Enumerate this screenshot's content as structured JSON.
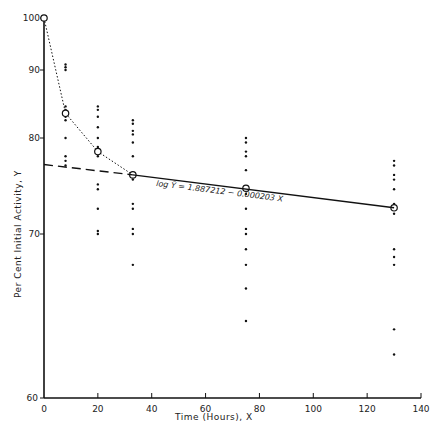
{
  "chart_data": {
    "type": "scatter",
    "title": "",
    "xlabel": "Time (Hours), X",
    "ylabel": "Per Cent Initial Activity, Y",
    "xlim": [
      0,
      140
    ],
    "ylim": [
      60,
      100
    ],
    "x_ticks": [
      0,
      20,
      40,
      60,
      80,
      100,
      120,
      140
    ],
    "y_ticks": [
      60,
      70,
      80,
      90,
      100
    ],
    "y_scale": "log",
    "grid": false,
    "legend": null,
    "annotation": "log Ŷ = 1.887212 − 0.000203 X",
    "series": [
      {
        "name": "observations",
        "style": "dots",
        "points": [
          [
            8,
            91
          ],
          [
            8,
            90.5
          ],
          [
            8,
            90
          ],
          [
            8,
            84.5
          ],
          [
            8,
            84
          ],
          [
            8,
            83.5
          ],
          [
            8,
            83
          ],
          [
            8,
            82.5
          ],
          [
            8,
            80
          ],
          [
            8,
            78
          ],
          [
            8,
            77.5
          ],
          [
            8,
            77
          ],
          [
            20,
            84.5
          ],
          [
            20,
            84
          ],
          [
            20,
            83
          ],
          [
            20,
            81.5
          ],
          [
            20,
            80
          ],
          [
            20,
            79
          ],
          [
            20,
            78
          ],
          [
            20,
            75
          ],
          [
            20,
            74.5
          ],
          [
            20,
            72.5
          ],
          [
            20,
            70.3
          ],
          [
            20,
            70
          ],
          [
            33,
            82.5
          ],
          [
            33,
            82
          ],
          [
            33,
            81
          ],
          [
            33,
            80.5
          ],
          [
            33,
            79.5
          ],
          [
            33,
            78
          ],
          [
            33,
            75.5
          ],
          [
            33,
            73
          ],
          [
            33,
            72.5
          ],
          [
            33,
            70.5
          ],
          [
            33,
            70
          ],
          [
            33,
            68
          ],
          [
            75,
            80
          ],
          [
            75,
            79.5
          ],
          [
            75,
            78.5
          ],
          [
            75,
            78
          ],
          [
            75,
            76.5
          ],
          [
            75,
            74
          ],
          [
            75,
            72.5
          ],
          [
            75,
            70.5
          ],
          [
            75,
            70
          ],
          [
            75,
            69
          ],
          [
            75,
            68
          ],
          [
            75,
            66.5
          ],
          [
            75,
            64.5
          ],
          [
            130,
            77.5
          ],
          [
            130,
            77
          ],
          [
            130,
            76
          ],
          [
            130,
            75.5
          ],
          [
            130,
            74.5
          ],
          [
            130,
            73
          ],
          [
            130,
            72.8
          ],
          [
            130,
            72
          ],
          [
            130,
            69
          ],
          [
            130,
            68.5
          ],
          [
            130,
            68
          ],
          [
            130,
            64
          ],
          [
            130,
            62.5
          ]
        ]
      },
      {
        "name": "means",
        "style": "open-circles-dotted-line",
        "points": [
          [
            0,
            100
          ],
          [
            8,
            83.5
          ],
          [
            20,
            78.5
          ],
          [
            33,
            76
          ],
          [
            75,
            74.6
          ],
          [
            130,
            72.6
          ]
        ]
      },
      {
        "name": "fitted line",
        "style": "solid",
        "points": [
          [
            33,
            76
          ],
          [
            130,
            72.6
          ]
        ]
      },
      {
        "name": "extrapolated line",
        "style": "dashed",
        "points": [
          [
            0,
            77.1
          ],
          [
            33,
            76
          ]
        ]
      }
    ]
  }
}
